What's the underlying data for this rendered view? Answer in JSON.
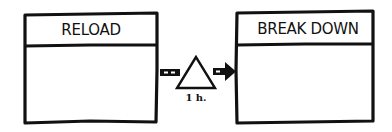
{
  "diagram": {
    "type": "value-stream-process-flow",
    "style": "hand-drawn",
    "colors": {
      "stroke": "#111111",
      "background": "#ffffff"
    },
    "processes": [
      {
        "id": "reload",
        "label": "RELOAD"
      },
      {
        "id": "break_down",
        "label": "BREAK DOWN"
      }
    ],
    "inventory": {
      "icon": "triangle-inventory-icon",
      "wait_time": "1 h."
    },
    "connectors": [
      {
        "from": "reload",
        "to": "inventory",
        "style": "push-arrow-dashed"
      },
      {
        "from": "inventory",
        "to": "break_down",
        "style": "push-arrow"
      }
    ]
  }
}
